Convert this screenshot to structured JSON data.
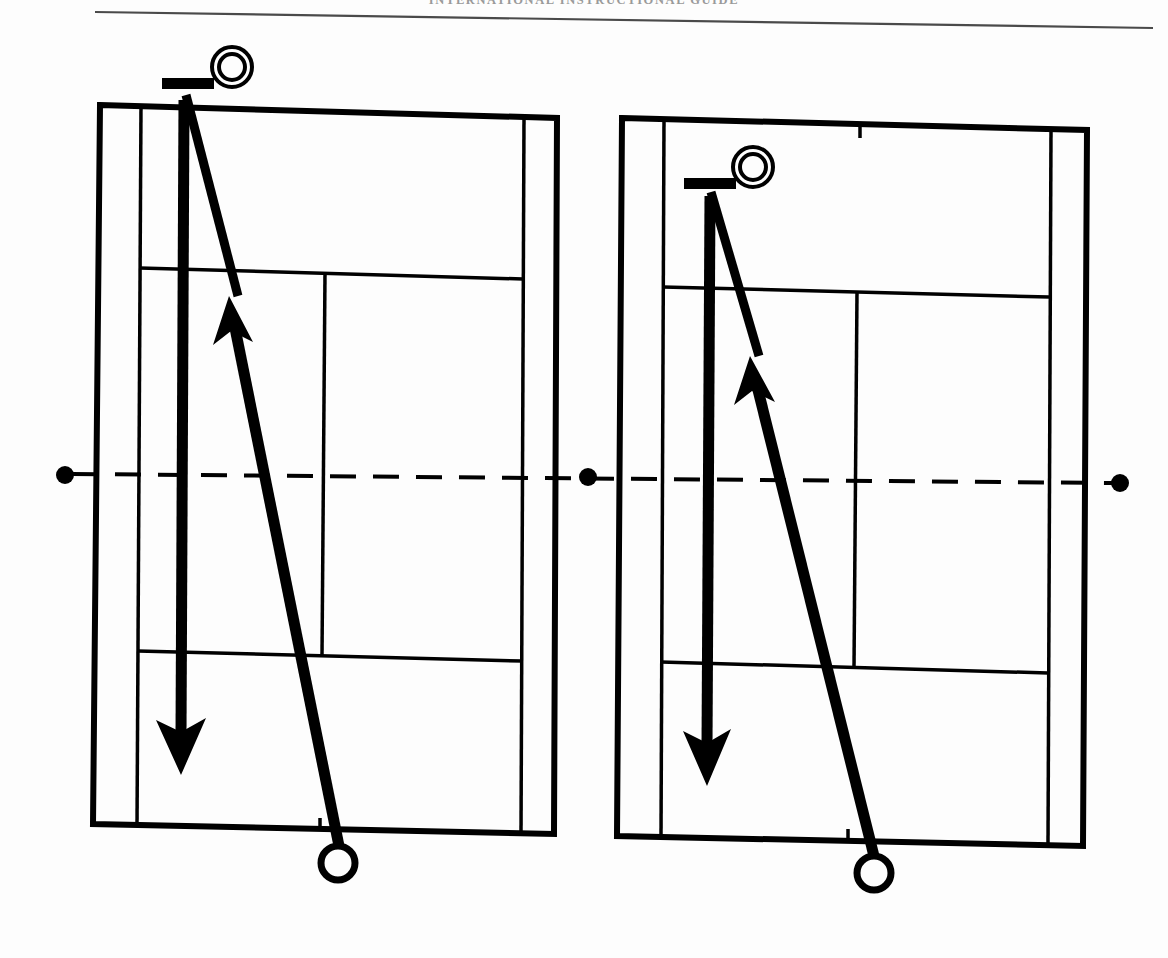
{
  "page": {
    "running_head": "INTERNATIONAL INSTRUCTIONAL GUIDE",
    "background_color": "#fdfdfd",
    "ink_color": "#000000",
    "width": 1168,
    "height": 958
  },
  "figure": {
    "type": "tennis-court-tactics-diagram",
    "panel_count": 2,
    "net": {
      "style": "dashed",
      "label": "net-line",
      "y": 475,
      "end_dot_radius": 9,
      "dots": [
        {
          "name": "net-dot-left",
          "x": 65,
          "y": 475
        },
        {
          "name": "net-dot-center",
          "x": 588,
          "y": 477
        },
        {
          "name": "net-dot-right",
          "x": 1120,
          "y": 483
        }
      ]
    },
    "panels": [
      {
        "id": "left-court",
        "name": "Court diagram 1",
        "court": {
          "top_left": [
            100,
            105
          ],
          "top_right": [
            557,
            118
          ],
          "bottom_right": [
            554,
            834
          ],
          "bottom_left": [
            93,
            824
          ],
          "far_service_line_y": 270,
          "near_service_line_y": 652,
          "singles_sideline_left_x": 140,
          "singles_sideline_right_x": 522,
          "center_service_line_x": 324,
          "center_mark_x": 320
        },
        "player": {
          "name": "player-marker",
          "racket_bar": {
            "x": 162,
            "y": 78,
            "width": 52,
            "height": 11
          },
          "head": {
            "cx": 232,
            "cy": 67,
            "r_outer": 20,
            "r_inner": 13
          },
          "position_label": "far baseline, left of center"
        },
        "ball": {
          "name": "ball-marker",
          "cx": 338,
          "cy": 863,
          "r": 17
        },
        "movement_arrow": {
          "name": "down-the-line-movement-arrow",
          "from": [
            184,
            100
          ],
          "to": [
            181,
            760
          ],
          "direction": "down",
          "stroke_width": 11
        },
        "shot_arrow": {
          "name": "cross-court-shot-arrow",
          "from": [
            338,
            845
          ],
          "to": [
            227,
            292
          ],
          "direction": "up-left",
          "stroke_width": 11
        }
      },
      {
        "id": "right-court",
        "name": "Court diagram 2",
        "court": {
          "top_left": [
            622,
            118
          ],
          "top_right": [
            1087,
            130
          ],
          "bottom_right": [
            1082,
            845
          ],
          "bottom_left": [
            617,
            836
          ],
          "far_service_line_y": 288,
          "near_service_line_y": 663,
          "singles_sideline_left_x": 663,
          "singles_sideline_right_x": 1049,
          "center_service_line_x": 855,
          "center_mark_x": 848
        },
        "player": {
          "name": "player-marker",
          "racket_bar": {
            "x": 684,
            "y": 178,
            "width": 52,
            "height": 11
          },
          "head": {
            "cx": 753,
            "cy": 167,
            "r_outer": 20,
            "r_inner": 13
          },
          "position_label": "inside far service box, left of center"
        },
        "ball": {
          "name": "ball-marker",
          "cx": 874,
          "cy": 873,
          "r": 17
        },
        "movement_arrow": {
          "name": "down-the-line-movement-arrow",
          "from": [
            709,
            198
          ],
          "to": [
            707,
            772
          ],
          "direction": "down",
          "stroke_width": 11
        },
        "shot_arrow": {
          "name": "cross-court-shot-arrow",
          "from": [
            872,
            855
          ],
          "to": [
            750,
            352
          ],
          "direction": "up-left",
          "stroke_width": 11
        }
      }
    ],
    "legend": {
      "player_symbol": "double-circle-with-bar",
      "ball_symbol": "open-circle",
      "movement_symbol": "solid-arrow",
      "shot_symbol": "solid-arrow"
    }
  }
}
